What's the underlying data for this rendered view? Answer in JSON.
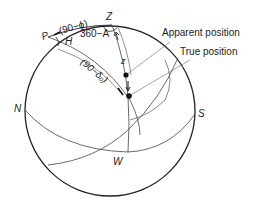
{
  "diagram": {
    "type": "celestial-sphere",
    "points": {
      "P": "P",
      "Z": "Z",
      "N": "N",
      "S": "S",
      "W": "W"
    },
    "arc_labels": {
      "colatitude": "(90−ϕ)",
      "azimuth": "360−A",
      "hour_angle": "H",
      "codeclination": "(90−δ₀)",
      "zenith_distance": "z"
    },
    "callouts": {
      "apparent": "Apparent position",
      "true": "True position"
    },
    "colors": {
      "line": "#222222",
      "thin_line": "#555555",
      "background": "#ffffff"
    }
  }
}
